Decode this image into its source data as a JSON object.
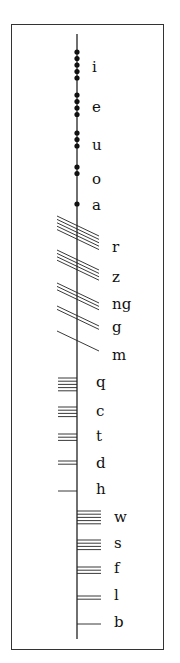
{
  "stem": {
    "x": 77,
    "top": 34,
    "bottom": 639,
    "color": "#222222"
  },
  "groups": [
    {
      "name": "vowels",
      "stroke_type": "dot",
      "letters": [
        {
          "label": "i",
          "count": 5,
          "y": 52,
          "label_y": 60
        },
        {
          "label": "e",
          "count": 4,
          "y": 95,
          "label_y": 100
        },
        {
          "label": "u",
          "count": 3,
          "y": 133,
          "label_y": 138
        },
        {
          "label": "o",
          "count": 2,
          "y": 167,
          "label_y": 172
        },
        {
          "label": "a",
          "count": 1,
          "y": 204,
          "label_y": 198
        }
      ]
    },
    {
      "name": "aicme-muine",
      "stroke_type": "diagonal",
      "letters": [
        {
          "label": "r",
          "count": 5,
          "y": 216,
          "label_y": 240
        },
        {
          "label": "z",
          "count": 4,
          "y": 250,
          "label_y": 270
        },
        {
          "label": "ng",
          "count": 3,
          "y": 283,
          "label_y": 297
        },
        {
          "label": "g",
          "count": 2,
          "y": 306,
          "label_y": 320
        },
        {
          "label": "m",
          "count": 1,
          "y": 331,
          "label_y": 348
        }
      ]
    },
    {
      "name": "aicme-huath",
      "stroke_type": "left",
      "letters": [
        {
          "label": "q",
          "count": 5,
          "y": 378,
          "label_y": 375
        },
        {
          "label": "c",
          "count": 4,
          "y": 407,
          "label_y": 404
        },
        {
          "label": "t",
          "count": 3,
          "y": 434,
          "label_y": 429
        },
        {
          "label": "d",
          "count": 2,
          "y": 461,
          "label_y": 456
        },
        {
          "label": "h",
          "count": 1,
          "y": 491,
          "label_y": 482
        }
      ]
    },
    {
      "name": "aicme-beithe",
      "stroke_type": "right",
      "letters": [
        {
          "label": "w",
          "count": 5,
          "y": 511,
          "label_y": 510
        },
        {
          "label": "s",
          "count": 4,
          "y": 540,
          "label_y": 536
        },
        {
          "label": "f",
          "count": 3,
          "y": 567,
          "label_y": 561
        },
        {
          "label": "l",
          "count": 2,
          "y": 596,
          "label_y": 588
        },
        {
          "label": "b",
          "count": 1,
          "y": 624,
          "label_y": 615
        }
      ]
    }
  ]
}
